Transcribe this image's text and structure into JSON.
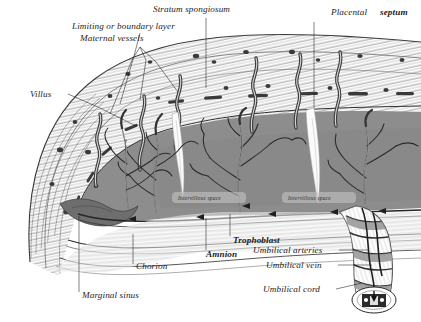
{
  "figure": {
    "medium": "engraving",
    "background": "#ffffff",
    "ink": "#1d1d1d"
  },
  "palette": {
    "ink": "#1d1d1d",
    "decidua_fill": "#fdfdfd",
    "hatch": "#6e6e6e",
    "intervillous_space": "#8d8d8d",
    "intervillous_space_dark": "#7a7a7a",
    "maternal_vessel": "#4a4a4a",
    "vessel_dark": "#2e2e2e",
    "marginal_sinus": "#6a6a6a",
    "villus_white": "#f4f4f4",
    "septum_white": "#fbfbfb",
    "cord_shade": "#9a9a9a",
    "caption_gray": "#b9b9b9"
  },
  "labels": [
    {
      "id": "stratum-spongiosum",
      "text": "Stratum spongiosum",
      "x": 153,
      "y": 12,
      "anchor": "start",
      "bold": false
    },
    {
      "id": "limiting-layer",
      "text": "Limiting or boundary layer",
      "x": 72,
      "y": 29,
      "anchor": "start",
      "bold": false
    },
    {
      "id": "maternal-vessels",
      "text": "Maternal vessels",
      "x": 80,
      "y": 41,
      "anchor": "start",
      "bold": false
    },
    {
      "id": "placental-septum-a",
      "text": "Placental",
      "x": 331,
      "y": 15,
      "anchor": "start",
      "bold": false
    },
    {
      "id": "placental-septum-b",
      "text": "septum",
      "x": 380,
      "y": 15,
      "anchor": "start",
      "bold": true
    },
    {
      "id": "villus",
      "text": "Villus",
      "x": 30,
      "y": 97,
      "anchor": "start",
      "bold": false
    },
    {
      "id": "trophoblast",
      "text": "Trophoblast",
      "x": 233,
      "y": 243,
      "anchor": "start",
      "bold": true
    },
    {
      "id": "amnion",
      "text": "Amnion",
      "x": 206,
      "y": 257,
      "anchor": "start",
      "bold": true
    },
    {
      "id": "chorion",
      "text": "Chorion",
      "x": 136,
      "y": 269,
      "anchor": "start",
      "bold": false
    },
    {
      "id": "marginal-sinus",
      "text": "Marginal sinus",
      "x": 82,
      "y": 298,
      "anchor": "start",
      "bold": false
    },
    {
      "id": "umbilical-arteries",
      "text": "Umbilical arteries",
      "x": 253,
      "y": 253,
      "anchor": "start",
      "bold": false
    },
    {
      "id": "umbilical-vein",
      "text": "Umbilical vein",
      "x": 266,
      "y": 268,
      "anchor": "start",
      "bold": false
    },
    {
      "id": "umbilical-cord",
      "text": "Umbilical cord",
      "x": 263,
      "y": 292,
      "anchor": "start",
      "bold": false
    }
  ],
  "inline_labels": [
    {
      "id": "intervillous-space-1",
      "text": "Intervillous  space",
      "x": 178,
      "y": 200
    },
    {
      "id": "intervillous-space-2",
      "text": "Intervillous  space",
      "x": 288,
      "y": 200
    }
  ],
  "structures": [
    {
      "id": "decidua-basalis",
      "name": "Decidua basalis / stratum spongiosum band"
    },
    {
      "id": "limiting-layer-band",
      "name": "Limiting or boundary layer"
    },
    {
      "id": "maternal-spiral-artery",
      "name": "Maternal spiral vessels",
      "count": 6
    },
    {
      "id": "placental-septum-wedge",
      "name": "Placental septum",
      "count": 2
    },
    {
      "id": "villous-tree",
      "name": "Chorionic villous tree",
      "count": 4
    },
    {
      "id": "intervillous-lake",
      "name": "Intervillous space"
    },
    {
      "id": "chorion-membrane",
      "name": "Chorion"
    },
    {
      "id": "amnion-membrane",
      "name": "Amnion"
    },
    {
      "id": "marginal-sinus-blob",
      "name": "Marginal sinus"
    },
    {
      "id": "umbilical-cord-coil",
      "name": "Umbilical cord with coiled vessels"
    },
    {
      "id": "cord-cross-section",
      "name": "Umbilical cord cross-section"
    }
  ],
  "flow_arrows": {
    "count": 6,
    "meaning": "maternal blood flow direction in intervillous space"
  },
  "caption": {
    "text": ""
  }
}
